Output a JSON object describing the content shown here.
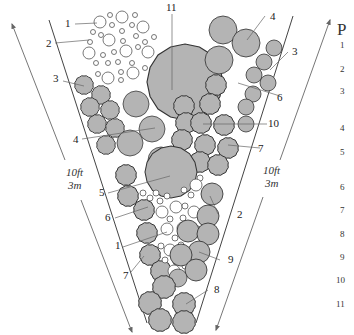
{
  "diagram": {
    "type": "planting-plan",
    "colors": {
      "plant_fill": "#b4b4b4",
      "plant_stroke": "#333333",
      "small_circle_fill": "#ffffff",
      "line": "#555555",
      "background": "#ffffff"
    },
    "dimensions": {
      "left": {
        "imperial": "10ft",
        "metric": "3m"
      },
      "right": {
        "imperial": "10ft",
        "metric": "3m"
      }
    },
    "callouts": [
      {
        "id": "c1a",
        "label": "1"
      },
      {
        "id": "c2a",
        "label": "2"
      },
      {
        "id": "c3a",
        "label": "3"
      },
      {
        "id": "c4a",
        "label": "4"
      },
      {
        "id": "c11",
        "label": "11"
      },
      {
        "id": "c4b",
        "label": "4"
      },
      {
        "id": "c3b",
        "label": "3"
      },
      {
        "id": "c6a",
        "label": "6"
      },
      {
        "id": "c10",
        "label": "10"
      },
      {
        "id": "c7a",
        "label": "7"
      },
      {
        "id": "c5",
        "label": "5"
      },
      {
        "id": "c6b",
        "label": "6"
      },
      {
        "id": "c2b",
        "label": "2"
      },
      {
        "id": "c1b",
        "label": "1"
      },
      {
        "id": "c9",
        "label": "9"
      },
      {
        "id": "c7b",
        "label": "7"
      },
      {
        "id": "c8",
        "label": "8"
      }
    ]
  },
  "legend": {
    "title": "P",
    "items": [
      "1",
      "2",
      "3",
      "4",
      "5",
      "6",
      "7",
      "8",
      "9",
      "10",
      "11"
    ]
  }
}
